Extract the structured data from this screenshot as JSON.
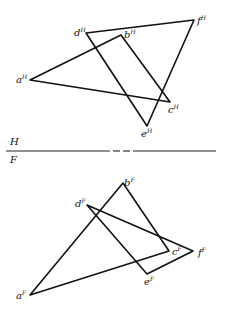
{
  "diagram": {
    "type": "descriptive-geometry-projection",
    "reference_line": {
      "upper_plane_label": "H",
      "lower_plane_label": "F",
      "y": 151,
      "segments": [
        [
          6,
          110
        ],
        [
          113,
          120
        ],
        [
          123,
          130
        ],
        [
          133,
          216
        ]
      ]
    },
    "top_view": {
      "points": {
        "a": {
          "x": 30,
          "y": 80,
          "label": "a",
          "sup": "H",
          "lx": 16,
          "ly": 83
        },
        "b": {
          "x": 121,
          "y": 35,
          "label": "b",
          "sup": "H",
          "lx": 124,
          "ly": 38
        },
        "c": {
          "x": 170,
          "y": 102,
          "label": "c",
          "sup": "H",
          "lx": 168,
          "ly": 113
        },
        "d": {
          "x": 86,
          "y": 33,
          "label": "d",
          "sup": "H",
          "lx": 74,
          "ly": 36
        },
        "e": {
          "x": 147,
          "y": 126,
          "label": "e",
          "sup": "H",
          "lx": 141,
          "ly": 137
        },
        "f": {
          "x": 194,
          "y": 20,
          "label": "f",
          "sup": "H",
          "lx": 197,
          "ly": 24
        }
      },
      "triangles": [
        [
          "a",
          "b",
          "c"
        ],
        [
          "d",
          "e",
          "f"
        ]
      ]
    },
    "front_view": {
      "points": {
        "a": {
          "x": 30,
          "y": 295,
          "label": "a",
          "sup": "F",
          "lx": 16,
          "ly": 299
        },
        "b": {
          "x": 123,
          "y": 183,
          "label": "b",
          "sup": "F",
          "lx": 124,
          "ly": 186
        },
        "c": {
          "x": 169,
          "y": 251,
          "label": "c",
          "sup": "F",
          "lx": 172,
          "ly": 255
        },
        "d": {
          "x": 87,
          "y": 205,
          "label": "d",
          "sup": "F",
          "lx": 75,
          "ly": 207
        },
        "e": {
          "x": 147,
          "y": 274,
          "label": "e",
          "sup": "F",
          "lx": 144,
          "ly": 285
        },
        "f": {
          "x": 193,
          "y": 251,
          "label": "f",
          "sup": "F",
          "lx": 198,
          "ly": 256
        }
      },
      "triangles": [
        [
          "a",
          "b",
          "c"
        ],
        [
          "d",
          "e",
          "f"
        ]
      ]
    },
    "colors": {
      "line": "#111111",
      "background": "#ffffff"
    }
  }
}
